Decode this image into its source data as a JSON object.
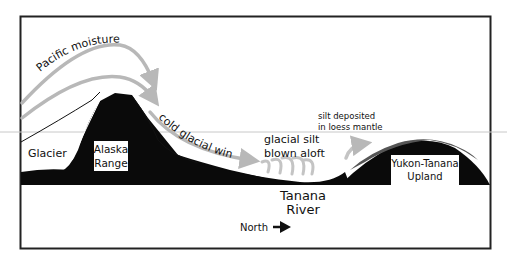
{
  "diagram": {
    "labels": {
      "pacific_moisture": "Pacific moisture",
      "cold_glacial_winds": "cold glacial winds",
      "glacier": "Glacier",
      "alaska_range_line1": "Alaska",
      "alaska_range_line2": "Range",
      "glacial_silt_line1": "glacial silt",
      "glacial_silt_line2": "blown aloft",
      "silt_deposited_line1": "silt deposited",
      "silt_deposited_line2": "in loess mantle",
      "yukon_tanana_line1": "Yukon-Tanana",
      "yukon_tanana_line2": "Upland",
      "tanana_river_line1": "Tanana",
      "tanana_river_line2": "River",
      "north": "North"
    },
    "icons": {
      "north_arrow": "right-arrow"
    },
    "colors": {
      "terrain": "#0a0a0a",
      "arrows": "#b8b8b8",
      "loess": "#555555",
      "frame": "#222222",
      "guide_line": "#c8c8c8"
    }
  }
}
